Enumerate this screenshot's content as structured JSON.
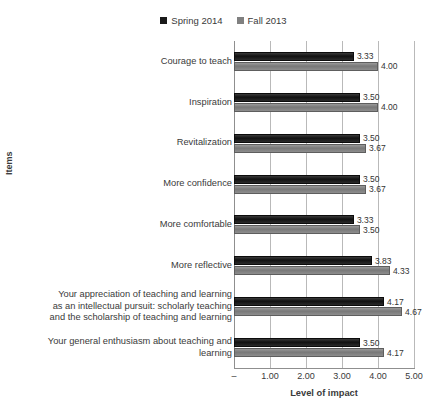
{
  "chart_data": {
    "type": "bar",
    "orientation": "horizontal",
    "title": "",
    "xlabel": "Level of impact",
    "ylabel": "Items",
    "xlim": [
      0,
      5
    ],
    "xticks": [
      "–",
      "1.00",
      "2.00",
      "3.00",
      "4.00",
      "5.00"
    ],
    "xtick_values": [
      0,
      1,
      2,
      3,
      4,
      5
    ],
    "grid": true,
    "legend_position": "top-center",
    "categories": [
      "Courage to teach",
      "Inspiration",
      "Revitalization",
      "More confidence",
      "More comfortable",
      "More reflective",
      "Your appreciation of teaching and learning as an intellectual pursuit: scholarly teaching and the scholarship of teaching and learning",
      "Your general enthusiasm about teaching and learning"
    ],
    "category_lines": [
      [
        "Courage to teach"
      ],
      [
        "Inspiration"
      ],
      [
        "Revitalization"
      ],
      [
        "More confidence"
      ],
      [
        "More comfortable"
      ],
      [
        "More reflective"
      ],
      [
        "Your appreciation of teaching and learning",
        "as an intellectual pursuit: scholarly teaching",
        "and the scholarship of teaching and learning"
      ],
      [
        "Your general enthusiasm about teaching and",
        "learning"
      ]
    ],
    "series": [
      {
        "name": "Spring 2014",
        "color": "#1a1a1a",
        "values": [
          3.33,
          3.5,
          3.5,
          3.5,
          3.33,
          3.83,
          4.17,
          3.5
        ],
        "labels": [
          "3.33",
          "3.50",
          "3.50",
          "3.50",
          "3.33",
          "3.83",
          "4.17",
          "3.50"
        ]
      },
      {
        "name": "Fall 2013",
        "color": "#808080",
        "values": [
          4.0,
          4.0,
          3.67,
          3.67,
          3.5,
          4.33,
          4.67,
          4.17
        ],
        "labels": [
          "4.00",
          "4.00",
          "3.67",
          "3.67",
          "3.50",
          "4.33",
          "4.67",
          "4.17"
        ]
      }
    ]
  },
  "legend": {
    "entries": [
      {
        "label": "Spring 2014",
        "color": "#1a1a1a"
      },
      {
        "label": "Fall 2013",
        "color": "#808080"
      }
    ]
  },
  "axes": {
    "x_title": "Level of impact",
    "y_title": "Items"
  }
}
